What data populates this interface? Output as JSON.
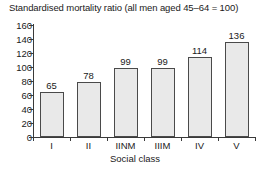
{
  "chart_data": {
    "type": "bar",
    "title": "Standardised mortality ratio (all men aged 45–64 = 100)",
    "xlabel": "Social class",
    "ylabel": "",
    "categories": [
      "I",
      "II",
      "IINM",
      "IIIM",
      "IV",
      "V"
    ],
    "values": [
      65,
      78,
      99,
      99,
      114,
      136
    ],
    "data_labels": [
      "65",
      "78",
      "99",
      "99",
      "114",
      "136"
    ],
    "ylim": [
      0,
      160
    ],
    "yticks": [
      0,
      20,
      40,
      60,
      80,
      100,
      120,
      140,
      160
    ],
    "ytick_labels": [
      "0",
      "20",
      "40",
      "60",
      "80",
      "100",
      "120",
      "140",
      "160"
    ],
    "grid": false,
    "legend": false,
    "bar_fill_color": "#e9e9e9",
    "bar_edge_color": "#4a4a4a",
    "axis_color": "#3a3a3a",
    "text_color": "#1a1a1a",
    "background_color": "#ffffff"
  }
}
